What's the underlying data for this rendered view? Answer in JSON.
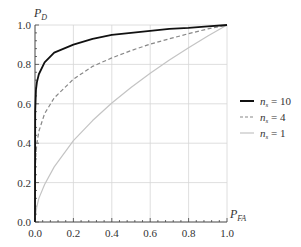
{
  "chart_data": {
    "type": "line",
    "title": "",
    "xlabel": "P_FA",
    "ylabel": "P_D",
    "xlim": [
      0.0,
      1.0
    ],
    "ylim": [
      0.0,
      1.0
    ],
    "grid": true,
    "legend_position": "right",
    "x_ticks": [
      "0.0",
      "0.2",
      "0.4",
      "0.6",
      "0.8",
      "1.0"
    ],
    "y_ticks": [
      "0.0",
      "0.2",
      "0.4",
      "0.6",
      "0.8",
      "1.0"
    ],
    "x": [
      0.0,
      0.001,
      0.005,
      0.01,
      0.02,
      0.05,
      0.1,
      0.2,
      0.3,
      0.4,
      0.5,
      0.6,
      0.7,
      0.8,
      0.9,
      1.0
    ],
    "series": [
      {
        "name": "n_s = 10",
        "color": "#111111",
        "style": "solid",
        "width": 1.8,
        "values": [
          0.0,
          0.56,
          0.67,
          0.71,
          0.75,
          0.81,
          0.86,
          0.9,
          0.93,
          0.95,
          0.96,
          0.97,
          0.98,
          0.985,
          0.993,
          1.0
        ]
      },
      {
        "name": "n_s = 4",
        "color": "#888888",
        "style": "dashed",
        "width": 1.2,
        "values": [
          0.0,
          0.25,
          0.35,
          0.4,
          0.46,
          0.55,
          0.63,
          0.725,
          0.79,
          0.833,
          0.87,
          0.903,
          0.93,
          0.956,
          0.98,
          1.0
        ]
      },
      {
        "name": "n_s = 1",
        "color": "#c4c4c4",
        "style": "solid",
        "width": 1.2,
        "values": [
          0.0,
          0.02,
          0.05,
          0.08,
          0.12,
          0.19,
          0.28,
          0.413,
          0.515,
          0.604,
          0.683,
          0.755,
          0.822,
          0.884,
          0.944,
          1.0
        ]
      }
    ]
  },
  "axes": {
    "y_label_main": "P",
    "y_label_sub": "D",
    "x_label_main": "P",
    "x_label_sub": "FA"
  },
  "legend": {
    "items": [
      {
        "main": "n",
        "sub": "s",
        "rest": " = 10"
      },
      {
        "main": "n",
        "sub": "s",
        "rest": " = 4"
      },
      {
        "main": "n",
        "sub": "s",
        "rest": " = 1"
      }
    ]
  }
}
